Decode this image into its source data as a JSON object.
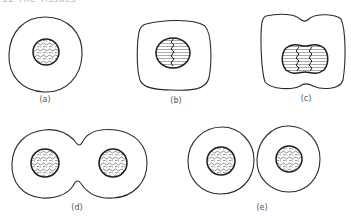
{
  "header": {
    "text": "12   The Tissues"
  },
  "figures": [
    {
      "id": "a",
      "label": "(a)",
      "description": "Interphase cell with round nucleus and granular chromatin"
    },
    {
      "id": "b",
      "label": "(b)",
      "description": "Cell with condensed chromosomes aligning at equatorial plate"
    },
    {
      "id": "c",
      "label": "(c)",
      "description": "Elongated cell with separating chromosomes and beginning cleavage"
    },
    {
      "id": "d",
      "label": "(d)",
      "description": "Dumbbell-shaped cell with two daughter nuclei, cleavage furrow deepening"
    },
    {
      "id": "e",
      "label": "(e)",
      "description": "Two separate daughter cells each with round nucleus"
    }
  ],
  "colors": {
    "stroke": "#2a2a2a",
    "chromatin": "#444444",
    "label": "#555555"
  }
}
